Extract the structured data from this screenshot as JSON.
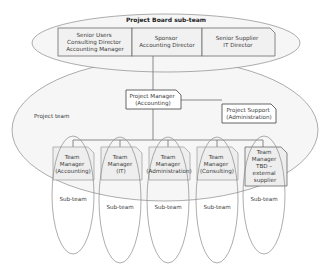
{
  "diagram": {
    "type": "organization-chart",
    "board": {
      "title": "Project Board sub-team",
      "members": [
        {
          "lines": [
            "Senior Users",
            "Consulting Director",
            "Accounting Manager"
          ]
        },
        {
          "lines": [
            "Sponsor",
            "Accounting Director"
          ]
        },
        {
          "lines": [
            "Senior Supplier",
            "IT Director"
          ]
        }
      ]
    },
    "project_team": {
      "label": "Project team",
      "project_manager": {
        "lines": [
          "Project Manager",
          "(Accounting)"
        ]
      },
      "project_support": {
        "lines": [
          "Project Support",
          "(Administration)"
        ]
      }
    },
    "team_managers": [
      {
        "lines": [
          "Team",
          "Manager",
          "(Accounting)"
        ],
        "subteam_label": "Sub-team"
      },
      {
        "lines": [
          "Team",
          "Manager",
          "(IT)"
        ],
        "subteam_label": "Sub-team"
      },
      {
        "lines": [
          "Team",
          "Manager",
          "(Administration)"
        ],
        "subteam_label": "Sub-team"
      },
      {
        "lines": [
          "Team",
          "Manager",
          "(Consulting)"
        ],
        "subteam_label": "Sub-team"
      },
      {
        "lines": [
          "Team",
          "Manager",
          "TBD –",
          "external",
          "supplier"
        ],
        "subteam_label": "Sub-team"
      }
    ],
    "colors": {
      "outline": "#8a8a8a",
      "box_fill": "#f1f1f1",
      "text": "#3a3a3a"
    }
  }
}
